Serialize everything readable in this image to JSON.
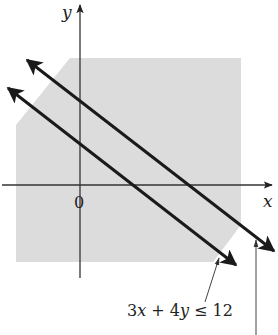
{
  "figure": {
    "axes": {
      "x_label": "x",
      "y_label": "y",
      "origin_label": "0"
    },
    "shaded_region": {
      "fill": "#dcdcdc",
      "polygon": [
        [
          70,
          58
        ],
        [
          241,
          58
        ],
        [
          241,
          225
        ],
        [
          213,
          262
        ],
        [
          16,
          262
        ],
        [
          16,
          125
        ]
      ]
    },
    "lines": [
      {
        "name": "line-upper",
        "from": [
          27,
          60
        ],
        "to": [
          274,
          251
        ],
        "color": "#1a1a1a"
      },
      {
        "name": "line-lower",
        "from": [
          8,
          88
        ],
        "to": [
          236,
          265
        ],
        "color": "#1a1a1a"
      }
    ],
    "annotations": [
      {
        "name": "inequality-label",
        "text_parts": [
          "3",
          "x",
          " + 4",
          "y",
          " ≤ 12"
        ],
        "pointer_from": [
          205,
          302
        ],
        "pointer_to": [
          219,
          258
        ]
      },
      {
        "name": "upper-line-pointer",
        "text": "",
        "pointer_from": [
          256,
          335
        ],
        "pointer_to": [
          256,
          240
        ]
      }
    ],
    "colors": {
      "axis": "#333333",
      "line": "#1a1a1a",
      "shade": "#dcdcdc",
      "text": "#222222"
    }
  }
}
